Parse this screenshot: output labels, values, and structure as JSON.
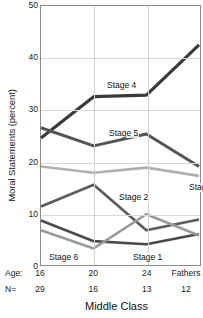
{
  "chart_data": {
    "type": "line",
    "title": "Middle Class",
    "xlabel": "",
    "ylabel": "Moral Statements (percent)",
    "ylim": [
      0,
      50
    ],
    "yticks": [
      0,
      10,
      20,
      30,
      40,
      50
    ],
    "grid": true,
    "legend": "inline-labels",
    "categories": [
      "16",
      "20",
      "24",
      "Fathers"
    ],
    "x_axis_rows": [
      {
        "key": "Age:",
        "values": [
          "16",
          "20",
          "24",
          "Fathers"
        ]
      },
      {
        "key": "N=",
        "values": [
          "29",
          "16",
          "13",
          "12"
        ]
      }
    ],
    "series": [
      {
        "name": "Stage 1",
        "values": [
          8.6,
          4.6,
          4.0,
          6.0
        ],
        "color": "#4a4a4a",
        "width": 2.6
      },
      {
        "name": "Stage 2",
        "values": [
          11.3,
          15.5,
          6.7,
          8.8
        ],
        "color": "#5a5a5a",
        "width": 2.6
      },
      {
        "name": "Stage 3",
        "values": [
          19.0,
          17.8,
          18.8,
          17.2
        ],
        "color": "#b0b0b0",
        "width": 2.6
      },
      {
        "name": "Stage 4",
        "values": [
          24.5,
          32.5,
          32.8,
          42.5
        ],
        "color": "#3a3a3a",
        "width": 3.2
      },
      {
        "name": "Stage 5",
        "values": [
          26.5,
          23.0,
          25.3,
          19.0
        ],
        "color": "#555555",
        "width": 3.0
      },
      {
        "name": "Stage 6",
        "values": [
          6.7,
          3.2,
          9.8,
          5.7
        ],
        "color": "#9a9a9a",
        "width": 2.6
      }
    ],
    "series_labels": [
      {
        "name": "Stage 4",
        "text": "Stage 4",
        "x": 66,
        "y": 76
      },
      {
        "name": "Stage 5",
        "text": "Stage 5",
        "x": 68,
        "y": 124
      },
      {
        "name": "Stage 3",
        "text": "Stage 3",
        "x": 148,
        "y": 178
      },
      {
        "name": "Stage 2",
        "text": "Stage 2",
        "x": 78,
        "y": 188
      },
      {
        "name": "Stage 1",
        "text": "Stage 1",
        "x": 92,
        "y": 248
      },
      {
        "name": "Stage 6",
        "text": "Stage 6",
        "x": 8,
        "y": 248
      }
    ]
  }
}
